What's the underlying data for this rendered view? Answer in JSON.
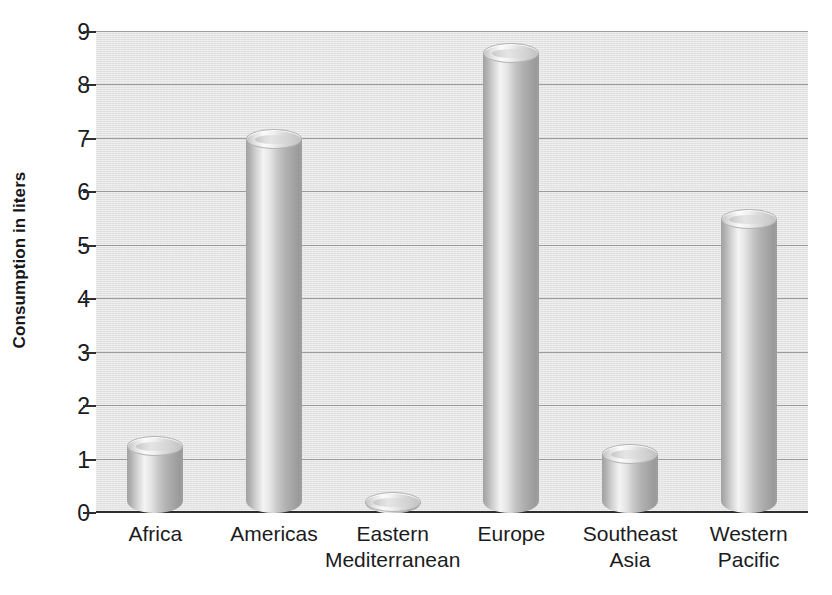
{
  "chart_data": {
    "type": "bar",
    "title": "",
    "subtitle": "",
    "xlabel": "",
    "ylabel": "Consumption in liters",
    "categories": [
      "Africa",
      "Americas",
      "Eastern\nMediterranean",
      "Europe",
      "Southeast\nAsia",
      "Western\nPacific"
    ],
    "values": [
      1.25,
      7.0,
      0.2,
      8.6,
      1.1,
      5.5
    ],
    "ylim": [
      0,
      9
    ],
    "ytick_labels": [
      "0",
      "1",
      "2",
      "3",
      "4",
      "5",
      "6",
      "7",
      "8",
      "9"
    ],
    "ytick_values": [
      0,
      1,
      2,
      3,
      4,
      5,
      6,
      7,
      8,
      9
    ],
    "grid": true,
    "legend": "none",
    "bar_style": "3d-cylinder",
    "colors": {
      "plot_background": "#e5e5e5",
      "gridline": "#8e8e8e",
      "axis": "#2e2e2e",
      "bar_light": "#f4f4f4",
      "bar_dark": "#9a9a9a",
      "text": "#1b1b1e"
    }
  }
}
